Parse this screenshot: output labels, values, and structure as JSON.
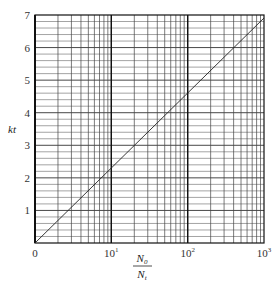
{
  "chart_data": {
    "type": "line",
    "title": "",
    "xlabel": "N0/Nt",
    "xlabel_numerator": "N",
    "xlabel_numerator_sub": "0",
    "xlabel_denominator": "N",
    "xlabel_denominator_sub": "t",
    "ylabel": "kt",
    "xscale": "log",
    "xlim": [
      1,
      1000
    ],
    "ylim": [
      0,
      7
    ],
    "x_tick_labels": [
      {
        "value": 1,
        "label": "0"
      },
      {
        "value": 10,
        "label": "10",
        "sup": "1"
      },
      {
        "value": 100,
        "label": "10",
        "sup": "2"
      },
      {
        "value": 1000,
        "label": "10",
        "sup": "3"
      }
    ],
    "y_ticks": [
      1,
      2,
      3,
      4,
      5,
      6,
      7
    ],
    "y_minor_step": 0.2,
    "grid": true,
    "series": [
      {
        "name": "kt = ln(N0/Nt)",
        "x": [
          1,
          10,
          100,
          1000
        ],
        "y": [
          0,
          2.303,
          4.605,
          6.908
        ]
      }
    ]
  }
}
